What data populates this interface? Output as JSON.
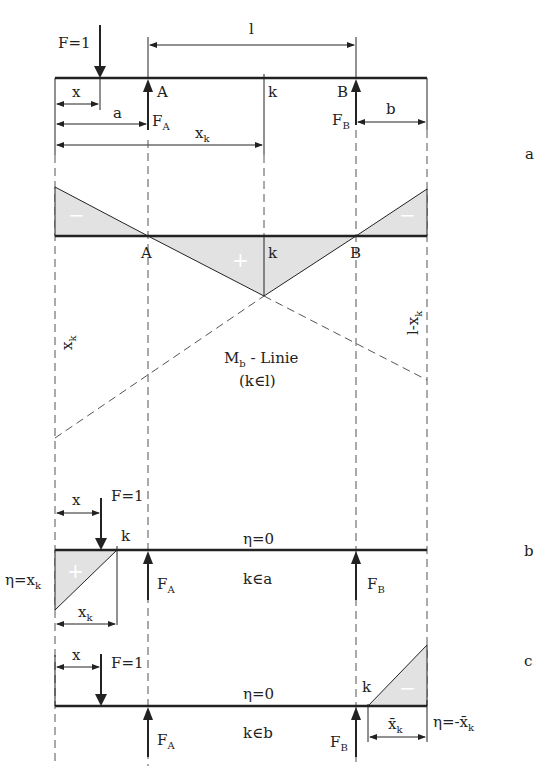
{
  "diagram": {
    "panels": [
      {
        "id": "a",
        "label": "a",
        "load": "F=1",
        "dims": {
          "x": "x",
          "a": "a",
          "l": "l",
          "b": "b",
          "xk_main": "x",
          "xk_sub": "k"
        },
        "supports": {
          "A": "A",
          "B": "B",
          "FA_main": "F",
          "FA_sub": "A",
          "FB_main": "F",
          "FB_sub": "B"
        },
        "section": "k",
        "influence_line": {
          "signs": {
            "left": "−",
            "middle": "+",
            "right": "−"
          },
          "points": {
            "A": "A",
            "B": "B",
            "k": "k"
          },
          "left_ordinate_main": "x",
          "left_ordinate_sub": "k",
          "right_ordinate": "l-x",
          "right_ordinate_sub": "k",
          "caption_main": "M",
          "caption_sub": "b",
          "caption_rest": " - Linie",
          "caption_cond": "(k∈l)"
        }
      },
      {
        "id": "b",
        "label": "b",
        "load": "F=1",
        "dim_x": "x",
        "section": "k",
        "eta_zero": "η=0",
        "eta_left": "η=x",
        "eta_left_sub": "k",
        "dim_xk": "x",
        "dim_xk_sub": "k",
        "sign": "+",
        "FA_main": "F",
        "FA_sub": "A",
        "FB_main": "F",
        "FB_sub": "B",
        "condition": "k∈a"
      },
      {
        "id": "c",
        "label": "c",
        "load": "F=1",
        "dim_x": "x",
        "section": "k",
        "eta_zero": "η=0",
        "eta_right": "η=-x̄",
        "eta_right_sub": "k",
        "dim_xk": "x̄",
        "dim_xk_sub": "k",
        "sign": "−",
        "FA_main": "F",
        "FA_sub": "A",
        "FB_main": "F",
        "FB_sub": "B",
        "condition": "k∈b"
      }
    ],
    "colors": {
      "line": "#222222",
      "fill": "#e2e2e2",
      "dash": "#555555"
    }
  }
}
